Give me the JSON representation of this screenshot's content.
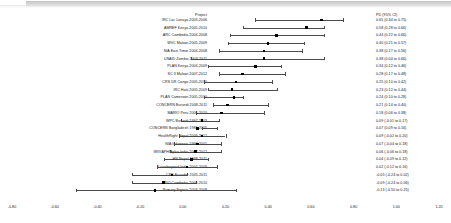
{
  "headers": {
    "project": "Project",
    "effect": "PD (95% CI)"
  },
  "chart_data": {
    "type": "scatter",
    "subtype": "forest-plot",
    "title": "",
    "xlabel": "",
    "ylabel": "",
    "xlim": [
      -0.8,
      1.2
    ],
    "xticks": [
      "-0.80",
      "-0.60",
      "-0.40",
      "-0.20",
      "0.00",
      "0.20",
      "0.40",
      "0.60",
      "0.80",
      "1.00",
      "1.20"
    ],
    "xtick_values": [
      -0.8,
      -0.6,
      -0.4,
      -0.2,
      0.0,
      0.2,
      0.4,
      0.6,
      0.8,
      1.0,
      1.2
    ],
    "grid": false,
    "legend": false,
    "effect_measure": "PD (95% CI)",
    "marker_color": "#000000",
    "line_color": "#4a4a4a",
    "categories": [
      "IRC Lac Lanaya 2003-2006",
      "AMREF Kenya 2005-2010",
      "ARC Cambodia 2004-2008",
      "WVC Malawi 2005-2009",
      "NIA East Timor 2004-2008",
      "USAID Zambia 2003-2011",
      "PLAN Kenya 2004-2009",
      "SC II Malawi 2007-2012",
      "CRS DR Congo 2005-2010",
      "IRC Haiti 2005-2009",
      "PLAN Cameroon 2005-2010",
      "CONCERN Burundi 2008-2011",
      "MARIO Peru 2006-2010",
      "WPC Burundi 1997-2003",
      "CONCERN Bangladesh 1989-2005",
      "HealthRight Nepal 2009-2012",
      "NIA Indonesia 1998-2001",
      "WVI/APHIAplus India 2007-2012",
      "HN Nepal 1998-2011",
      "Lovelnspired India 2004-2009",
      "CRS Ecuador 2005-2011",
      "RIO Cambodia 2006-2010",
      "Primary Nigeria 2003-2008"
    ],
    "values": [
      0.65,
      0.58,
      0.44,
      0.4,
      0.38,
      0.38,
      0.34,
      0.28,
      0.25,
      0.23,
      0.24,
      0.21,
      0.18,
      0.09,
      0.07,
      0.09,
      0.07,
      0.06,
      0.04,
      0.02,
      -0.05,
      -0.09,
      -0.13
    ],
    "ci_low": [
      0.34,
      0.28,
      0.22,
      0.21,
      0.17,
      0.04,
      0.12,
      0.17,
      0.1,
      0.12,
      0.1,
      0.14,
      0.06,
      -0.01,
      0.09,
      -0.02,
      -0.04,
      -0.06,
      -0.09,
      -0.12,
      -0.24,
      -0.24,
      -0.5
    ],
    "ci_high": [
      0.75,
      0.66,
      0.66,
      0.57,
      0.56,
      0.66,
      0.46,
      0.48,
      0.42,
      0.44,
      0.28,
      0.4,
      0.38,
      0.17,
      0.16,
      0.2,
      0.18,
      0.18,
      0.12,
      0.16,
      0.02,
      0.06,
      0.25
    ],
    "rows": [
      {
        "label": "IRC Lac Lanaya 2003-2006",
        "text": "0.65 (0.34 to 0.75)"
      },
      {
        "label": "AMREF Kenya 2005-2010",
        "text": "0.58 (0.28 to 0.66)"
      },
      {
        "label": "ARC Cambodia 2004-2008",
        "text": "0.44 (0.22 to 0.66)"
      },
      {
        "label": "WVC Malawi 2005-2009",
        "text": "0.40 (0.21 to 0.57)"
      },
      {
        "label": "NIA East Timor 2004-2008",
        "text": "0.38 (0.17 to 0.56)"
      },
      {
        "label": "USAID Zambia 2003-2011",
        "text": "0.38 (0.04 to 0.66)"
      },
      {
        "label": "PLAN Kenya 2004-2009",
        "text": "0.34 (0.12 to 0.46)"
      },
      {
        "label": "SC II Malawi 2007-2012",
        "text": "0.28 (0.17 to 0.48)"
      },
      {
        "label": "CRS DR Congo 2005-2010",
        "text": "0.25 (0.10 to 0.42)"
      },
      {
        "label": "IRC Haiti 2005-2009",
        "text": "0.23 (0.12 to 0.44)"
      },
      {
        "label": "PLAN Cameroon 2005-2010",
        "text": "0.24 (0.10 to 0.28)"
      },
      {
        "label": "CONCERN Burundi 2008-2011",
        "text": "0.21 (0.14 to 0.40)"
      },
      {
        "label": "MARIO Peru 2006-2010",
        "text": "0.18 (0.06 to 0.38)"
      },
      {
        "label": "WPC Burundi 1997-2003",
        "text": "0.09 (-0.01 to 0.17)"
      },
      {
        "label": "CONCERN Bangladesh 1989-2005",
        "text": "0.07 (0.09 to 0.16)"
      },
      {
        "label": "HealthRight Nepal 2009-2012",
        "text": "0.09 (-0.02 to 0.20)"
      },
      {
        "label": "NIA Indonesia 1998-2001",
        "text": "0.07 (-0.04 to 0.18)"
      },
      {
        "label": "WVI/APHIAplus India 2007-2012",
        "text": "0.06 (-0.06 to 0.18)"
      },
      {
        "label": "HN Nepal 1998-2011",
        "text": "0.04 (-0.09 to 0.12)"
      },
      {
        "label": "Lovelnspired India 2004-2009",
        "text": "0.02 (-0.12 to 0.16)"
      },
      {
        "label": "CRS Ecuador 2005-2011",
        "text": "-0.05 (-0.24 to 0.02)"
      },
      {
        "label": "RIO Cambodia 2006-2010",
        "text": "-0.09 (-0.24 to 0.06)"
      },
      {
        "label": "Primary Nigeria 2003-2008",
        "text": "-0.13 (-0.50 to 0.25)"
      }
    ]
  }
}
